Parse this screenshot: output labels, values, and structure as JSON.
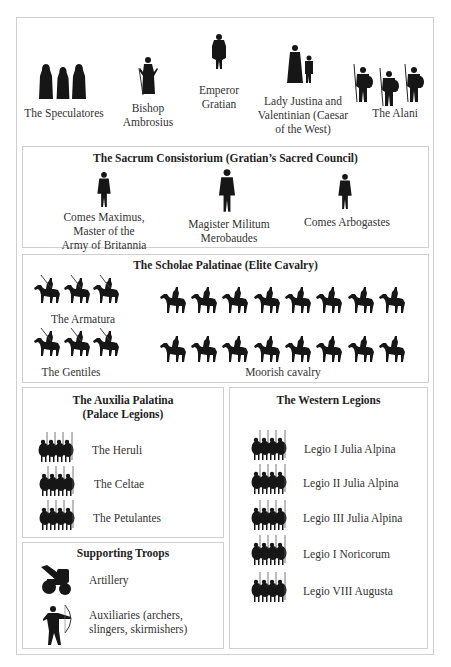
{
  "top": {
    "figures": [
      {
        "label": "The Speculatores",
        "icon": "cloaked-guards-icon"
      },
      {
        "label": "Bishop Ambrosius",
        "icon": "bishop-icon"
      },
      {
        "label": "Emperor Gratian",
        "icon": "emperor-icon"
      },
      {
        "label": "Lady Justina and Valentinian (Caesar of the West)",
        "icon": "woman-and-child-icon"
      },
      {
        "label": "The Alani",
        "icon": "spearmen-icon"
      }
    ],
    "labels": {
      "speculatores": "The Speculatores",
      "ambrosius_1": "Bishop",
      "ambrosius_2": "Ambrosius",
      "gratian_1": "Emperor",
      "gratian_2": "Gratian",
      "justina_1": "Lady Justina and",
      "justina_2": "Valentinian (Caesar",
      "justina_3": "of the West)",
      "alani": "The Alani"
    }
  },
  "consistorium": {
    "title": "The Sacrum Consistorium (Gratian’s Sacred Council)",
    "members": [
      {
        "lines": [
          "Comes Maximus,",
          "Master of the",
          "Army of Britannia"
        ]
      },
      {
        "lines": [
          "Magister Militum",
          "Merobaudes"
        ]
      },
      {
        "lines": [
          "Comes Arbogastes"
        ]
      }
    ]
  },
  "scholae": {
    "title": "The Scholae Palatinae (Elite Cavalry)",
    "units": [
      {
        "label": "The Armatura",
        "horsemen": 3
      },
      {
        "label": "The Gentiles",
        "horsemen": 3
      },
      {
        "label": "Moorish cavalry",
        "horsemen": 16
      }
    ]
  },
  "auxilia": {
    "title_1": "The Auxilia Palatina",
    "title_2": "(Palace Legions)",
    "units": [
      "The Heruli",
      "The Celtae",
      "The Petulantes"
    ]
  },
  "supporting": {
    "title": "Supporting Troops",
    "units": [
      {
        "lines": [
          "Artillery"
        ],
        "icon": "artillery-icon"
      },
      {
        "lines": [
          "Auxiliaries (archers,",
          "slingers, skirmishers)"
        ],
        "icon": "archer-icon"
      }
    ]
  },
  "western": {
    "title": "The Western Legions",
    "units": [
      "Legio I Julia Alpina",
      "Legio II Julia Alpina",
      "Legio III Julia Alpina",
      "Legio I Noricorum",
      "Legio VIII Augusta"
    ]
  }
}
